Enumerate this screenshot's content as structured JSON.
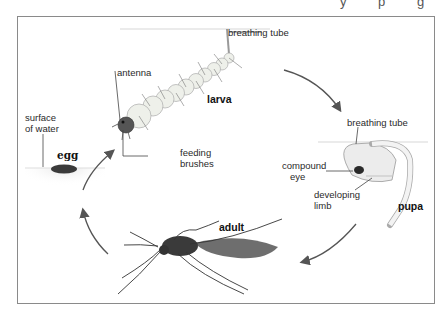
{
  "diagram": {
    "title_fragment": "y p g",
    "stages": {
      "egg": "egg",
      "larva": "larva",
      "pupa": "pupa",
      "adult": "adult"
    },
    "labels": {
      "surface_line1": "surface",
      "surface_line2": "of water",
      "antenna": "antenna",
      "larva_breathing_tube": "breathing tube",
      "feeding_line1": "feeding",
      "feeding_line2": "brushes",
      "pupa_breathing_tube": "breathing tube",
      "compound_line1": "compound",
      "compound_line2": "eye",
      "limb_line1": "developing",
      "limb_line2": "limb"
    },
    "colors": {
      "frame": "#8a8a8a",
      "arrow": "#555555",
      "insect_dark": "#3a3a3a",
      "segment_fill": "#eef0ea"
    }
  }
}
